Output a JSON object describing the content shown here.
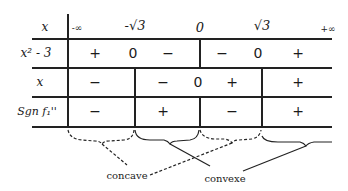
{
  "table": {
    "header": {
      "label": "x",
      "values": [
        {
          "text": "-∞",
          "x": 76
        },
        {
          "text": "-√3",
          "x": 135
        },
        {
          "text": "0",
          "x": 200
        },
        {
          "text": "√3",
          "x": 262
        },
        {
          "text": "+∞",
          "x": 330
        }
      ]
    },
    "rows": [
      {
        "label": "x² - 3",
        "cells": [
          {
            "text": "+",
            "x": 95
          },
          {
            "text": "0",
            "x": 133
          },
          {
            "text": "−",
            "x": 168
          },
          {
            "text": "−",
            "x": 222
          },
          {
            "text": "0",
            "x": 258
          },
          {
            "text": "+",
            "x": 298
          }
        ]
      },
      {
        "label": "x",
        "cells": [
          {
            "text": "−",
            "x": 95
          },
          {
            "text": "−",
            "x": 163
          },
          {
            "text": "0",
            "x": 198
          },
          {
            "text": "+",
            "x": 232
          },
          {
            "text": "+",
            "x": 298
          }
        ]
      },
      {
        "label": "Sgn f₁''",
        "cells": [
          {
            "text": "−",
            "x": 95
          },
          {
            "text": "+",
            "x": 163
          },
          {
            "text": "−",
            "x": 232
          },
          {
            "text": "+",
            "x": 298
          }
        ]
      }
    ]
  },
  "annotations": {
    "concave": "concave",
    "convexe": "convexe"
  }
}
